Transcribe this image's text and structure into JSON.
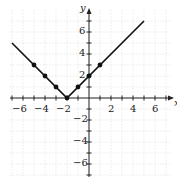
{
  "chart_data": {
    "type": "line",
    "title": "",
    "xlabel": "x",
    "ylabel": "y",
    "xlim": [
      -7,
      7
    ],
    "ylim": [
      -7,
      7
    ],
    "grid": true,
    "x_ticks": [
      -6,
      -4,
      -2,
      2,
      4,
      6
    ],
    "y_ticks": [
      6,
      4,
      2,
      -2,
      -4,
      -6
    ],
    "series": [
      {
        "name": "y = |x + 2|",
        "line": {
          "x": [
            -7,
            -2,
            5
          ],
          "y": [
            5,
            0,
            7
          ]
        },
        "points": {
          "x": [
            -5,
            -4,
            -3,
            -2,
            -1,
            0,
            1
          ],
          "y": [
            3,
            2,
            1,
            0,
            1,
            2,
            3
          ]
        }
      }
    ]
  },
  "labels": {
    "x_axis": "x",
    "y_axis": "y",
    "xt": [
      "−6",
      "−4",
      "−2",
      "2",
      "4",
      "6"
    ],
    "yt": [
      "6",
      "4",
      "2",
      "−2",
      "−4",
      "−6"
    ]
  }
}
